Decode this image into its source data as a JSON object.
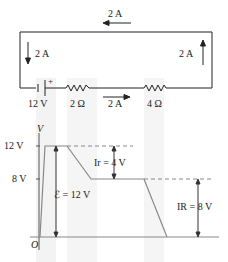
{
  "circuit": {
    "current_top": "2 A",
    "current_left": "2 A",
    "current_right": "2 A",
    "current_bottom": "2 A",
    "battery_label": "12 V",
    "battery_plus": "+",
    "r_internal_label": "2 Ω",
    "r_external_label": "4 Ω"
  },
  "graph": {
    "y_axis_label": "V",
    "origin_label": "O",
    "tick_12": "12 V",
    "tick_8": "8 V",
    "emf_label": "ℰ = 12 V",
    "ir_label": "Ir = 4 V",
    "IR_label": "IR = 8 V"
  },
  "colors": {
    "line": "#222222",
    "graph_line": "#888888",
    "band": "#f0f0f0"
  }
}
